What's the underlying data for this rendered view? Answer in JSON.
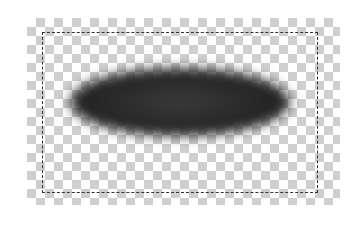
{
  "canvas": {
    "background": "transparency-checkerboard",
    "checker_colors": [
      "#ffffff",
      "#cfcfcf"
    ]
  },
  "shape": {
    "type": "blurred-ellipse",
    "color": "#2a2a2a"
  },
  "selection": {
    "style": "dashed-marquee",
    "color": "#333333"
  }
}
